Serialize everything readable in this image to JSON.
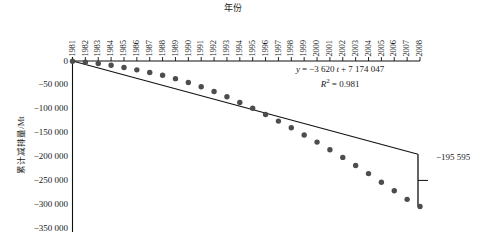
{
  "chart_data": {
    "type": "scatter",
    "title": "",
    "xlabel": "年份",
    "ylabel": "累计减排量/Mt",
    "categories": [
      1981,
      1982,
      1983,
      1984,
      1985,
      1986,
      1987,
      1988,
      1989,
      1990,
      1991,
      1992,
      1993,
      1994,
      1995,
      1996,
      1997,
      1998,
      1999,
      2000,
      2001,
      2002,
      2003,
      2004,
      2005,
      2006,
      2007,
      2008
    ],
    "x_tick_labels": [
      "1981",
      "1982",
      "1983",
      "1984",
      "1985",
      "1986",
      "1987",
      "1988",
      "1989",
      "1990",
      "1991",
      "1992",
      "1993",
      "1994",
      "1995",
      "1996",
      "1997",
      "1998",
      "1999",
      "2000",
      "2001",
      "2002",
      "2003",
      "2004",
      "2005",
      "2006",
      "2007",
      "2008"
    ],
    "y_tick_labels": [
      "0",
      "−50 000",
      "−100 000",
      "−150 000",
      "−200 000",
      "−250 000",
      "−300 000",
      "−350 000"
    ],
    "y_tick_values": [
      0,
      -50000,
      -100000,
      -150000,
      -200000,
      -250000,
      -300000,
      -350000
    ],
    "ylim": [
      -350000,
      0
    ],
    "xlim": [
      1981,
      2008
    ],
    "grid": false,
    "legend": "none",
    "series": [
      {
        "name": "累计减排量",
        "marker": "filled-circle",
        "color": "#4d4d4d",
        "values": [
          -600,
          -2400,
          -5200,
          -9000,
          -13500,
          -18500,
          -24000,
          -30000,
          -37000,
          -45000,
          -54000,
          -64000,
          -75000,
          -87000,
          -99000,
          -112000,
          -126000,
          -140000,
          -155000,
          -170000,
          -186000,
          -202000,
          -219000,
          -236000,
          -254000,
          -272000,
          -290000,
          -305000
        ]
      }
    ],
    "trendline": {
      "equation": "y = −3 620 t + 7 174 047",
      "equation_slope": -3620,
      "equation_intercept": 7174047,
      "r_squared_label": "R² = 0.981",
      "r_squared": 0.981,
      "start_value": 0,
      "end_value": -195595,
      "color": "#111111"
    },
    "annotations": [
      {
        "name": "bracket-end-value",
        "text": "−195 595",
        "value": -195595
      }
    ]
  },
  "equation": {
    "line1_prefix": "y",
    "line1_eq": "=",
    "line1_body": "−3 620",
    "line1_var": "t",
    "line1_tail": "+ 7 174 047",
    "line2_r": "R",
    "line2_sup": "2",
    "line2_eq": "= 0.981"
  },
  "axis": {
    "x_title": "年份",
    "y_title": "累计减排量/Mt"
  },
  "bracket": {
    "label": "−195 595"
  }
}
